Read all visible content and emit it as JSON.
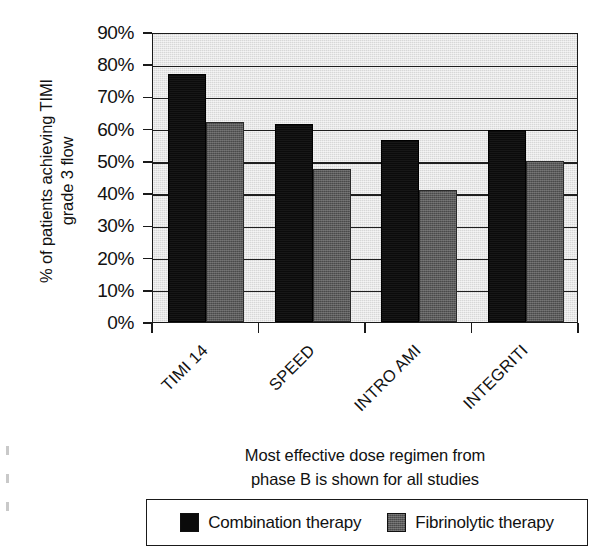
{
  "chart_data": {
    "type": "bar",
    "title": "",
    "subtitle": "",
    "categories": [
      "TIMI 14",
      "SPEED",
      "INTRO AMI",
      "INTEGRITI"
    ],
    "series": [
      {
        "name": "Combination therapy",
        "color": "#0b0b0b",
        "values": [
          77,
          61.5,
          56.5,
          59.5
        ]
      },
      {
        "name": "Fibrinolytic therapy",
        "color": "#5a5a5a",
        "values": [
          62,
          47.5,
          41,
          50
        ]
      }
    ],
    "ylabel": "% of patients achieving TIMI\ngrade 3 flow",
    "xlabel": "Most effective dose regimen from\nphase B is shown for all studies",
    "ylim": [
      0,
      90
    ],
    "ytick_values": [
      0,
      10,
      20,
      30,
      40,
      50,
      60,
      70,
      80,
      90
    ],
    "ytick_labels": [
      "0%",
      "10%",
      "20%",
      "30%",
      "40%",
      "50%",
      "60%",
      "70%",
      "80%",
      "90%"
    ],
    "grid": true,
    "grid_axis": "y",
    "legend_position": "bottom",
    "xtick_label_rotation": 45,
    "plot_background": "#d7d7d7",
    "axis_color": "#1a1a1a"
  },
  "legend": {
    "items": [
      {
        "label": "Combination therapy",
        "swatch": "dark"
      },
      {
        "label": "Fibrinolytic therapy",
        "swatch": "gray"
      }
    ]
  }
}
